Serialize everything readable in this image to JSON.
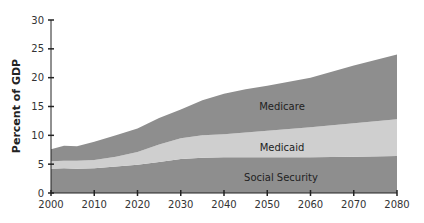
{
  "chart_data": {
    "type": "area",
    "stacked": true,
    "title": "",
    "xlabel": "",
    "ylabel": "Percent of GDP",
    "xlim": [
      2000,
      2080
    ],
    "ylim": [
      0,
      30
    ],
    "x_ticks": [
      2000,
      2010,
      2020,
      2030,
      2040,
      2050,
      2060,
      2070,
      2080
    ],
    "y_ticks": [
      0,
      5,
      10,
      15,
      20,
      25,
      30
    ],
    "grid": false,
    "legend": "inline labels",
    "x": [
      2000,
      2003,
      2006,
      2010,
      2015,
      2020,
      2025,
      2030,
      2035,
      2040,
      2045,
      2050,
      2060,
      2070,
      2080
    ],
    "series": [
      {
        "name": "Social Security",
        "color": "#8e8e8e",
        "values": [
          4.2,
          4.3,
          4.2,
          4.3,
          4.6,
          4.9,
          5.4,
          5.9,
          6.1,
          6.2,
          6.2,
          6.2,
          6.2,
          6.3,
          6.4
        ]
      },
      {
        "name": "Medicaid",
        "color": "#cfcfcf",
        "values": [
          1.3,
          1.3,
          1.4,
          1.4,
          1.7,
          2.2,
          3.0,
          3.6,
          3.9,
          4.0,
          4.3,
          4.6,
          5.2,
          5.8,
          6.4
        ]
      },
      {
        "name": "Medicare",
        "color": "#8e8e8e",
        "values": [
          2.1,
          2.6,
          2.5,
          3.2,
          3.7,
          4.1,
          4.6,
          5.0,
          6.1,
          7.0,
          7.5,
          7.8,
          8.6,
          10.0,
          11.2
        ]
      }
    ],
    "totals": [
      7.6,
      8.2,
      8.1,
      8.9,
      10.0,
      11.2,
      13.0,
      14.5,
      16.1,
      17.2,
      18.0,
      18.6,
      20.0,
      22.1,
      24.0
    ]
  }
}
